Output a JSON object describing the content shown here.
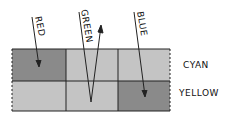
{
  "diagram": {
    "rays": [
      {
        "label": "RED",
        "direction": "down-into-filter"
      },
      {
        "label": "GREEN",
        "direction": "reflected-up"
      },
      {
        "label": "BLUE",
        "direction": "down-into-filter"
      }
    ],
    "rows": [
      {
        "label": "CYAN",
        "cells": [
          "dark",
          "light",
          "light"
        ]
      },
      {
        "label": "YELLOW",
        "cells": [
          "light",
          "light",
          "dark"
        ]
      }
    ],
    "colors": {
      "dark": "#8a8a8a",
      "light": "#c4c4c4",
      "stroke": "#222222"
    }
  }
}
